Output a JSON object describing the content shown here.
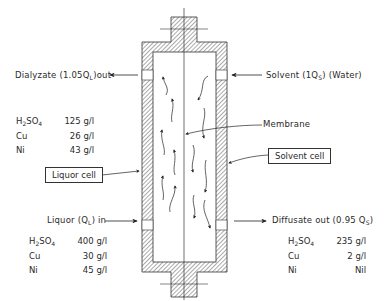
{
  "diagram": {
    "type": "dialysis cell schematic",
    "labels": {
      "dialyzate_out": "Dialyzate (1.05Q",
      "dialyzate_out_sub": "L",
      "dialyzate_out_tail": ")out",
      "solvent_in": "Solvent (1Q",
      "solvent_in_sub": "S",
      "solvent_in_tail": ")  (Water)",
      "membrane": "Membrane",
      "liquor_cell": "Liquor cell",
      "solvent_cell": "Solvent cell",
      "liquor_in": "Liquor (Q",
      "liquor_in_sub": "L",
      "liquor_in_tail": ") in",
      "diffusate_out": "Diffusate out  (0.95 Q",
      "diffusate_out_sub": "S",
      "diffusate_out_tail": ")"
    },
    "dialyzate_composition": [
      {
        "species": "H2SO4",
        "value": "125 g/l"
      },
      {
        "species": "Cu",
        "value": "26 g/l"
      },
      {
        "species": "Ni",
        "value": "43 g/l"
      }
    ],
    "liquor_composition": [
      {
        "species": "H2SO4",
        "value": "400 g/l"
      },
      {
        "species": "Cu",
        "value": "30 g/l"
      },
      {
        "species": "Ni",
        "value": "45 g/l"
      }
    ],
    "diffusate_composition": [
      {
        "species": "H2SO4",
        "value": "235 g/l"
      },
      {
        "species": "Cu",
        "value": "2 g/l"
      },
      {
        "species": "Ni",
        "value": "Nil"
      }
    ]
  }
}
